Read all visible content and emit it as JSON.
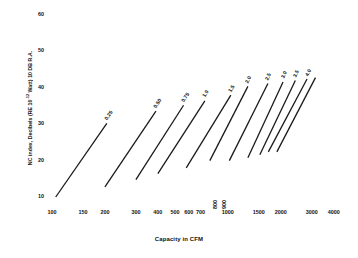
{
  "chart_data": {
    "type": "line",
    "title": "",
    "xlabel": "Capacity in CFM",
    "ylabel": "NC index, Decibels (RE 10-12 Watt) 10 DB R.A.",
    "ylabel_prefix": "NC index, Decibels (RE 10",
    "ylabel_exponent": "-12",
    "ylabel_suffix": " Watt) 10 DB R.A.",
    "xscale": "log",
    "yscale": "linear",
    "xlim": [
      100,
      4400
    ],
    "ylim": [
      8,
      62
    ],
    "grid": false,
    "legend": "inline-end-of-line",
    "xticks": [
      100,
      150,
      200,
      300,
      400,
      500,
      600,
      700,
      800,
      900,
      1000,
      1500,
      2000,
      3000,
      4000
    ],
    "xticklabels": [
      "100",
      "150",
      "200",
      "300",
      "400",
      "500",
      "600",
      "700",
      "800",
      "900",
      "1000",
      "1500",
      "2000",
      "3000",
      "4000"
    ],
    "xtick_rotated": [
      "800",
      "900"
    ],
    "yticks": [
      10,
      20,
      30,
      40,
      50,
      60
    ],
    "yticklabels": [
      "10",
      "20",
      "30",
      "40",
      "50",
      "60"
    ],
    "line_color": "#1a1a1a",
    "line_width": 1.3,
    "series": [
      {
        "name": "0.25",
        "label": "0.25",
        "x": [
          105,
          205
        ],
        "y": [
          10.0,
          30.2
        ]
      },
      {
        "name": "0.50",
        "label": "0.50",
        "x": [
          200,
          390
        ],
        "y": [
          12.8,
          33.6
        ]
      },
      {
        "name": "0.75",
        "label": "0.75",
        "x": [
          300,
          560
        ],
        "y": [
          14.8,
          35.2
        ]
      },
      {
        "name": "1.0",
        "label": "1.0",
        "x": [
          400,
          740
        ],
        "y": [
          16.4,
          36.4
        ]
      },
      {
        "name": "1.5",
        "label": "1.5",
        "x": [
          580,
          1040
        ],
        "y": [
          18.0,
          38.0
        ]
      },
      {
        "name": "2.0",
        "label": "2.0",
        "x": [
          790,
          1300
        ],
        "y": [
          20.0,
          40.4
        ]
      },
      {
        "name": "2.5",
        "label": "2.5",
        "x": [
          1020,
          1690
        ],
        "y": [
          20.0,
          41.2
        ]
      },
      {
        "name": "3.0",
        "label": "3.0",
        "x": [
          1300,
          2060
        ],
        "y": [
          20.8,
          41.6
        ]
      },
      {
        "name": "3.5",
        "label": "3.5",
        "x": [
          1520,
          2420
        ],
        "y": [
          21.6,
          42.0
        ]
      },
      {
        "name": "4.0",
        "label": "4.0",
        "x": [
          1700,
          2820
        ],
        "y": [
          22.4,
          42.4
        ]
      },
      {
        "name": "4.0b",
        "label": "",
        "x": [
          1900,
          3150
        ],
        "y": [
          22.4,
          42.8
        ]
      }
    ]
  },
  "figure": {
    "background": "#ffffff",
    "text_color": "#111111"
  }
}
